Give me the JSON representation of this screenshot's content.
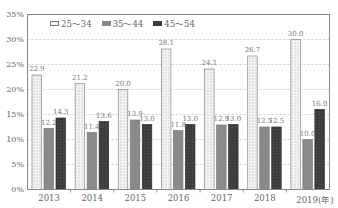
{
  "chart_data": {
    "type": "bar",
    "title": "",
    "xlabel": "",
    "ylabel": "",
    "x_unit_label": "(年)",
    "categories": [
      "2013",
      "2014",
      "2015",
      "2016",
      "2017",
      "2018",
      "2019"
    ],
    "series": [
      {
        "name": "25～34",
        "values": [
          22.9,
          21.2,
          20.0,
          28.1,
          24.1,
          26.7,
          30.0
        ],
        "color": "#f2f2f2",
        "pattern": "dotted"
      },
      {
        "name": "35～44",
        "values": [
          12.2,
          11.4,
          13.9,
          11.8,
          12.9,
          12.5,
          10.0
        ],
        "color": "#8a8a8a",
        "pattern": "solid"
      },
      {
        "name": "45～54",
        "values": [
          14.3,
          13.6,
          13.0,
          13.0,
          13.0,
          12.5,
          16.0
        ],
        "color": "#3c3c3c",
        "pattern": "dark-dotted"
      }
    ],
    "ylim": [
      0,
      35
    ],
    "yticks": [
      "0%",
      "5%",
      "10%",
      "15%",
      "20%",
      "25%",
      "30%",
      "35%"
    ],
    "grid": "horizontal dashed",
    "legend_position": "top-left inside"
  },
  "legend": {
    "items": [
      "25～34",
      "35～44",
      "45～54"
    ]
  },
  "axis": {
    "x_suffix": "(年)"
  }
}
